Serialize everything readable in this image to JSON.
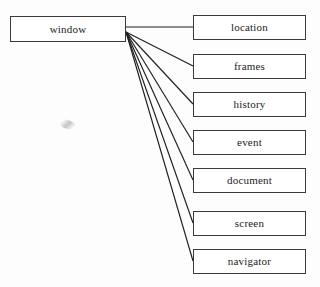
{
  "diagram": {
    "type": "tree",
    "root": {
      "id": "window",
      "label": "window",
      "x": 10,
      "y": 16,
      "width": 116,
      "height": 26
    },
    "children": [
      {
        "id": "location",
        "label": "location",
        "x": 193,
        "y": 15,
        "width": 113,
        "height": 25
      },
      {
        "id": "frames",
        "label": "frames",
        "x": 193,
        "y": 54,
        "width": 113,
        "height": 25
      },
      {
        "id": "history",
        "label": "history",
        "x": 193,
        "y": 92,
        "width": 113,
        "height": 25
      },
      {
        "id": "event",
        "label": "event",
        "x": 193,
        "y": 130,
        "width": 113,
        "height": 25
      },
      {
        "id": "document",
        "label": "document",
        "x": 193,
        "y": 168,
        "width": 113,
        "height": 25
      },
      {
        "id": "screen",
        "label": "screen",
        "x": 193,
        "y": 211,
        "width": 113,
        "height": 25
      },
      {
        "id": "navigator",
        "label": "navigator",
        "x": 193,
        "y": 249,
        "width": 113,
        "height": 25
      }
    ],
    "edges": [
      {
        "from": "window",
        "to": "location",
        "x1": 126,
        "y1": 27,
        "x2": 193,
        "y2": 27
      },
      {
        "from": "window",
        "to": "frames",
        "x1": 126,
        "y1": 32,
        "x2": 193,
        "y2": 66
      },
      {
        "from": "window",
        "to": "history",
        "x1": 126,
        "y1": 32,
        "x2": 193,
        "y2": 104
      },
      {
        "from": "window",
        "to": "event",
        "x1": 126,
        "y1": 32,
        "x2": 193,
        "y2": 142
      },
      {
        "from": "window",
        "to": "document",
        "x1": 126,
        "y1": 32,
        "x2": 193,
        "y2": 180
      },
      {
        "from": "window",
        "to": "screen",
        "x1": 126,
        "y1": 32,
        "x2": 193,
        "y2": 223
      },
      {
        "from": "window",
        "to": "navigator",
        "x1": 126,
        "y1": 32,
        "x2": 193,
        "y2": 261
      }
    ],
    "colors": {
      "background": "#fdfdfd",
      "box_border": "#3a3a3a",
      "box_fill": "#ffffff",
      "edge": "#1f1f1f",
      "text": "#1c1c1c"
    },
    "artifact": {
      "name": "scan-smudge",
      "x": 59,
      "y": 120,
      "width": 17,
      "height": 9
    }
  }
}
